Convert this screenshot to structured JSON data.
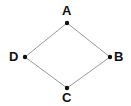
{
  "diagram": {
    "type": "quadrilateral-vertex-diagram",
    "shape": "rhombus",
    "background_color": "#ffffff",
    "edge_color": "#9a9a9a",
    "edge_width": 1,
    "vertex_dot_color": "#111111",
    "vertex_dot_radius": 2,
    "label_color": "#111111",
    "vertices": [
      {
        "id": "A",
        "label": "A",
        "x": 67,
        "y": 23,
        "label_x": 62,
        "label_y": 4
      },
      {
        "id": "B",
        "label": "B",
        "x": 110,
        "y": 57,
        "label_x": 114,
        "label_y": 50
      },
      {
        "id": "C",
        "label": "C",
        "x": 67,
        "y": 88,
        "label_x": 62,
        "label_y": 91
      },
      {
        "id": "D",
        "label": "D",
        "x": 25,
        "y": 57,
        "label_x": 9,
        "label_y": 50
      }
    ],
    "edges": [
      {
        "from": "A",
        "to": "B"
      },
      {
        "from": "B",
        "to": "C"
      },
      {
        "from": "C",
        "to": "D"
      },
      {
        "from": "D",
        "to": "A"
      }
    ]
  }
}
